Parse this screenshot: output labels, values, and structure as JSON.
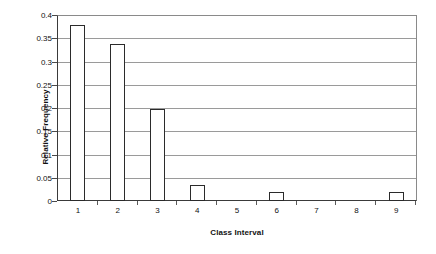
{
  "chart_data": {
    "type": "bar",
    "title": "",
    "xlabel": "Class Interval",
    "ylabel": "Relative Frequency",
    "categories": [
      "1",
      "2",
      "3",
      "4",
      "5",
      "6",
      "7",
      "8",
      "9"
    ],
    "values": [
      0.38,
      0.34,
      0.2,
      0.035,
      0,
      0.02,
      0,
      0,
      0.02
    ],
    "ylim": [
      0,
      0.4
    ],
    "yticks": [
      0,
      0.05,
      0.1,
      0.15,
      0.2,
      0.25,
      0.3,
      0.35,
      0.4
    ],
    "ytick_labels": [
      "0",
      "0.05",
      "0.1",
      "0.15",
      "0.2",
      "0.25",
      "0.3",
      "0.35",
      "0.4"
    ],
    "grid": "horizontal",
    "legend": "none",
    "bar_fill_color": "#ffffff",
    "bar_border_color": "#2b2b2b",
    "gridline_color": "#9a9a9a",
    "axis_color": "#3a3a3a",
    "background_color": "#ffffff"
  }
}
